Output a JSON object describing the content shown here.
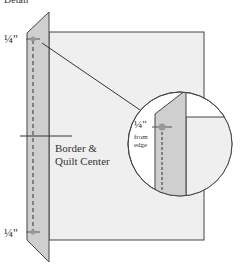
{
  "title_fragment": "Detail",
  "labels": {
    "top_measure": "¼\"",
    "bottom_measure": "¼\"",
    "center_label_line1": "Border &",
    "center_label_line2": "Quilt Center",
    "detail_measure": "¼\"",
    "detail_note_line1": "from",
    "detail_note_line2": "edge"
  },
  "colors": {
    "quilt_center_fill": "#efefef",
    "border_strip_fill": "#cfcfcf",
    "outline": "#444444",
    "pin_dot": "#999999"
  }
}
